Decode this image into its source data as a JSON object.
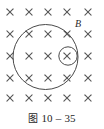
{
  "figure": {
    "caption_prefix": "图",
    "caption_number": "10 – 35",
    "field_label": "B",
    "field_label_meaning": "magnetic-flux-density",
    "background_color": "#ffffff",
    "cross_color": "#555555",
    "outline_color": "#4a4a4a",
    "label_color": "#2b2b2b"
  },
  "field_region": {
    "direction_symbol": "×",
    "direction_meaning": "into-the-page",
    "grid_columns": 5,
    "grid_rows": 5,
    "crosses": [
      {
        "x": 10,
        "y": 12
      },
      {
        "x": 29,
        "y": 12
      },
      {
        "x": 48,
        "y": 12
      },
      {
        "x": 67,
        "y": 12
      },
      {
        "x": 88,
        "y": 12
      },
      {
        "x": 10,
        "y": 34
      },
      {
        "x": 29,
        "y": 34
      },
      {
        "x": 48,
        "y": 34
      },
      {
        "x": 67,
        "y": 34
      },
      {
        "x": 88,
        "y": 34
      },
      {
        "x": 10,
        "y": 56
      },
      {
        "x": 29,
        "y": 56
      },
      {
        "x": 48,
        "y": 56
      },
      {
        "x": 67,
        "y": 56
      },
      {
        "x": 88,
        "y": 56
      },
      {
        "x": 10,
        "y": 78
      },
      {
        "x": 29,
        "y": 78
      },
      {
        "x": 48,
        "y": 78
      },
      {
        "x": 67,
        "y": 78
      },
      {
        "x": 88,
        "y": 78
      },
      {
        "x": 10,
        "y": 98
      },
      {
        "x": 29,
        "y": 98
      },
      {
        "x": 48,
        "y": 98
      },
      {
        "x": 67,
        "y": 98
      },
      {
        "x": 88,
        "y": 98
      }
    ],
    "cross_arm": 3.1
  },
  "shapes": {
    "large_circle": {
      "cx": 45.5,
      "cy": 57,
      "r": 32.5
    },
    "small_circle": {
      "cx": 68,
      "cy": 56,
      "r": 9.2
    }
  },
  "label_position": {
    "x": 75,
    "y": 27
  }
}
